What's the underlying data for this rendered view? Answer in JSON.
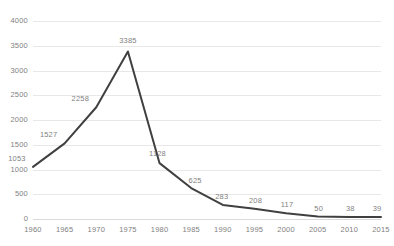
{
  "chart_data": {
    "type": "line",
    "title": "",
    "subtitle": "",
    "xlabel": "",
    "ylabel": "",
    "categories": [
      "1960",
      "1965",
      "1970",
      "1975",
      "1980",
      "1985",
      "1990",
      "1995",
      "2000",
      "2005",
      "2010",
      "2015"
    ],
    "x": [
      1960,
      1965,
      1970,
      1975,
      1980,
      1985,
      1990,
      1995,
      2000,
      2005,
      2010,
      2015
    ],
    "values": [
      1053,
      1527,
      2258,
      3385,
      1128,
      625,
      283,
      208,
      117,
      50,
      38,
      39
    ],
    "point_labels": [
      "1053",
      "1527",
      "2258",
      "3385",
      "1128",
      "625",
      "283",
      "208",
      "117",
      "50",
      "38",
      "39"
    ],
    "labels_shown": [
      true,
      true,
      true,
      true,
      true,
      true,
      true,
      true,
      true,
      true,
      true,
      true
    ],
    "ylim": [
      0,
      4000
    ],
    "ytick_step": 500,
    "yticks": [
      0,
      500,
      1000,
      1500,
      2000,
      2500,
      3000,
      3500,
      4000
    ],
    "ytick_labels": [
      "0",
      "500",
      "1000",
      "1500",
      "2000",
      "2500",
      "3000",
      "3500",
      "4000"
    ],
    "xtick_labels": [
      "1960",
      "1965",
      "1970",
      "1975",
      "1980",
      "1985",
      "1990",
      "1995",
      "2000",
      "2005",
      "2010",
      "2015"
    ],
    "grid": true,
    "grid_axis": "y",
    "legend": false,
    "legend_position": "none",
    "series": [
      {
        "name": "series-1",
        "values": [
          1053,
          1527,
          2258,
          3385,
          1128,
          625,
          283,
          208,
          117,
          50,
          38,
          39
        ]
      }
    ],
    "colors": {
      "line": "#404040",
      "grid": "#e8e8e8",
      "axis": "#d9d9d9",
      "tick_text": "#7f7f7f",
      "label_text": "#7f7f7f",
      "background": "#ffffff"
    },
    "line_width": 2
  }
}
